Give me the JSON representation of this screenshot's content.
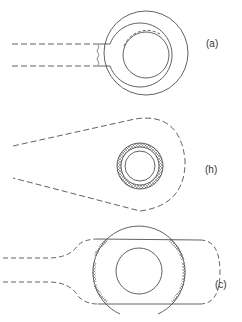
{
  "figures": [
    {
      "id": "a",
      "label": "(a)"
    },
    {
      "id": "b",
      "label": "(h)"
    },
    {
      "id": "c",
      "label": "(c)"
    }
  ],
  "colors": {
    "stroke": "#3a3a3a",
    "background": "#ffffff"
  }
}
